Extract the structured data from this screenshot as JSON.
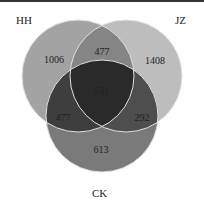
{
  "diagram": {
    "type": "venn3",
    "sets": [
      {
        "name": "HH",
        "color": "#9a9a9a"
      },
      {
        "name": "JZ",
        "color": "#b0b0b0"
      },
      {
        "name": "CK",
        "color": "#6e6e6e"
      }
    ],
    "regions": {
      "HH_only": "1006",
      "JZ_only": "1408",
      "CK_only": "613",
      "HH_JZ": "477",
      "HH_CK": "477",
      "JZ_CK": "292",
      "HH_JZ_CK": "531"
    }
  }
}
